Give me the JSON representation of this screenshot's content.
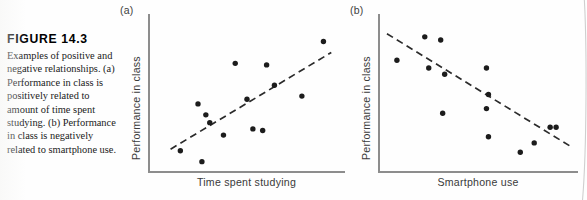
{
  "figure": {
    "number_label": "FIGURE 14.3",
    "caption": "Examples of positive and negative relationships. (a) Performance in class is positively related to amount of time spent studying. (b) Performance in class is negatively related to smartphone use.",
    "background_color": "#fefefe",
    "ink_color": "#1c1c1c",
    "axis_color": "#8d8d8d",
    "label_color": "#3a3a3a"
  },
  "panels": [
    {
      "key": "a",
      "label": "(a)",
      "xlabel": "Time spent studying",
      "ylabel": "Performance in class"
    },
    {
      "key": "b",
      "label": "(b)",
      "xlabel": "Smartphone use",
      "ylabel": "Performance in class"
    }
  ],
  "chart_data": [
    {
      "type": "scatter",
      "panel": "a",
      "title": "(a) Positive relationship",
      "xlabel": "Time spent studying",
      "ylabel": "Performance in class",
      "xlim": [
        0,
        100
      ],
      "ylim": [
        0,
        100
      ],
      "grid": false,
      "legend": "none",
      "axis_ticks": false,
      "relationship": "positive",
      "points": [
        {
          "x": 16,
          "y": 13
        },
        {
          "x": 27,
          "y": 6
        },
        {
          "x": 25,
          "y": 43
        },
        {
          "x": 29,
          "y": 36
        },
        {
          "x": 31,
          "y": 31
        },
        {
          "x": 38,
          "y": 23
        },
        {
          "x": 44,
          "y": 69
        },
        {
          "x": 50,
          "y": 46
        },
        {
          "x": 53,
          "y": 27
        },
        {
          "x": 58,
          "y": 26
        },
        {
          "x": 60,
          "y": 68
        },
        {
          "x": 64,
          "y": 55
        },
        {
          "x": 78,
          "y": 48
        },
        {
          "x": 89,
          "y": 83
        }
      ],
      "trendline": {
        "style": "dashed",
        "x1": 11,
        "y1": 14,
        "x2": 93,
        "y2": 76
      }
    },
    {
      "type": "scatter",
      "panel": "b",
      "title": "(b) Negative relationship",
      "xlabel": "Smartphone use",
      "ylabel": "Performance in class",
      "xlim": [
        0,
        100
      ],
      "ylim": [
        0,
        100
      ],
      "grid": false,
      "legend": "none",
      "axis_ticks": false,
      "relationship": "negative",
      "points": [
        {
          "x": 9,
          "y": 71
        },
        {
          "x": 23,
          "y": 86
        },
        {
          "x": 25,
          "y": 66
        },
        {
          "x": 31,
          "y": 84
        },
        {
          "x": 33,
          "y": 62
        },
        {
          "x": 32,
          "y": 37
        },
        {
          "x": 54,
          "y": 66
        },
        {
          "x": 55,
          "y": 49
        },
        {
          "x": 54,
          "y": 40
        },
        {
          "x": 55,
          "y": 22
        },
        {
          "x": 71,
          "y": 12
        },
        {
          "x": 78,
          "y": 18
        },
        {
          "x": 86,
          "y": 28
        },
        {
          "x": 89,
          "y": 28
        }
      ],
      "trendline": {
        "style": "dashed",
        "x1": 4,
        "y1": 88,
        "x2": 96,
        "y2": 16
      }
    }
  ]
}
